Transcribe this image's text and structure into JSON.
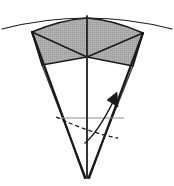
{
  "figure": {
    "title": "",
    "caption": "",
    "background_color": "#ffffff",
    "stroke_color": "#1a1a1a",
    "shade_color": "#a9a9a9",
    "shade_edge_color": "#6e6e6e",
    "thin_line_color": "#8c8c8c",
    "dash_color": "#1a1a1a",
    "width": 174,
    "height": 186,
    "elements": {
      "sphere_arc": {
        "name": "sphere-surface-arc",
        "path": "M 2 29 Q 87 7 172 29",
        "stroke_width": 1.1
      },
      "cap_outline": {
        "name": "spherical-cap-outline",
        "path": "M 32 32 Q 60 20 87 18 Q 114 20 143 33 L 133 66 L 87 57 L 42 65 Z",
        "stroke_width": 1.6
      },
      "cap_fold_left": {
        "name": "cap-fold-left",
        "path": "M 32 32 L 87 57",
        "stroke_width": 1.6
      },
      "cap_fold_right": {
        "name": "cap-fold-right",
        "path": "M 143 33 L 87 57",
        "stroke_width": 1.6
      },
      "cone_edge_left": {
        "name": "cone-edge-left",
        "path": "M 32 32 L 85 178",
        "stroke_width": 2.2
      },
      "cone_edge_right": {
        "name": "cone-edge-right",
        "path": "M 143 33 L 89 178",
        "stroke_width": 2.2
      },
      "cone_side_inner_left": {
        "name": "cone-inner-edge-left",
        "path": "M 42 65 L 86 178",
        "stroke_width": 1.3
      },
      "cone_side_inner_right": {
        "name": "cone-inner-edge-right",
        "path": "M 133 66 L 88 178",
        "stroke_width": 1.3
      },
      "axis": {
        "name": "cone-central-axis",
        "path": "M 87 16 L 87 178",
        "stroke_width": 1.9
      },
      "horizontal_reference": {
        "name": "horizontal-reference-line",
        "path": "M 57 118 L 124 118",
        "stroke_width": 1.0
      },
      "dashed_arc": {
        "name": "dashed-hidden-arc",
        "path": "M 56 117 Q 90 133 118 138",
        "stroke_width": 1.3,
        "dash_pattern": "4 3"
      },
      "angle_arrow": {
        "name": "angle-arrow",
        "path": "M 85 143 Q 98 132 113 102",
        "stroke_width": 1.5
      },
      "arrow_head": {
        "name": "angle-arrow-head",
        "points": "117 92 118 107 107 100"
      }
    }
  }
}
